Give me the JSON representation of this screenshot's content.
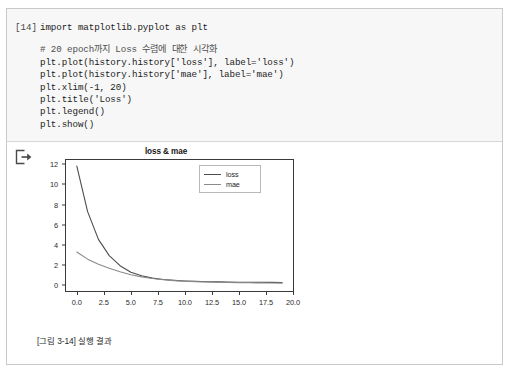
{
  "notebook": {
    "cell": {
      "execution_count_label": "[14]",
      "code_lines": [
        {
          "text": "import matplotlib.pyplot as plt",
          "kind": "code"
        },
        {
          "text": "",
          "kind": "blank"
        },
        {
          "text": "# 20 epoch까지 Loss 수렴에 대한 시각화",
          "kind": "comment"
        },
        {
          "text": "plt.plot(history.history['loss'], label='loss')",
          "kind": "code"
        },
        {
          "text": "plt.plot(history.history['mae'], label='mae')",
          "kind": "code"
        },
        {
          "text": "plt.xlim(-1, 20)",
          "kind": "code"
        },
        {
          "text": "plt.title('Loss')",
          "kind": "code"
        },
        {
          "text": "plt.legend()",
          "kind": "code"
        },
        {
          "text": "plt.show()",
          "kind": "code"
        }
      ]
    },
    "output": {
      "icon": "output-export-icon",
      "caption": "[그림 3-14] 실행 결과"
    }
  },
  "chart_data": {
    "type": "line",
    "title": "loss & mae",
    "xlabel": "",
    "ylabel": "",
    "xlim": [
      -1,
      20
    ],
    "ylim": [
      -0.55,
      12.4
    ],
    "grid": false,
    "legend_position": "upper right",
    "xticks": [
      "0.0",
      "2.5",
      "5.0",
      "7.5",
      "10.0",
      "12.5",
      "15.0",
      "17.5",
      "20.0"
    ],
    "xtick_values": [
      0.0,
      2.5,
      5.0,
      7.5,
      10.0,
      12.5,
      15.0,
      17.5,
      20.0
    ],
    "yticks": [
      "0",
      "2",
      "4",
      "6",
      "8",
      "10",
      "12"
    ],
    "ytick_values": [
      0,
      2,
      4,
      6,
      8,
      10,
      12
    ],
    "x": [
      0,
      1,
      2,
      3,
      4,
      5,
      6,
      7,
      8,
      9,
      10,
      11,
      12,
      13,
      14,
      15,
      16,
      17,
      18,
      19
    ],
    "series": [
      {
        "name": "loss",
        "color": "#4d4d4d",
        "values": [
          11.8,
          7.3,
          4.55,
          2.95,
          1.95,
          1.3,
          0.95,
          0.72,
          0.58,
          0.5,
          0.44,
          0.4,
          0.37,
          0.35,
          0.33,
          0.32,
          0.31,
          0.3,
          0.3,
          0.29
        ]
      },
      {
        "name": "mae",
        "color": "#8a8a8a",
        "values": [
          3.3,
          2.6,
          2.1,
          1.7,
          1.35,
          1.05,
          0.85,
          0.68,
          0.56,
          0.48,
          0.42,
          0.38,
          0.34,
          0.31,
          0.29,
          0.27,
          0.26,
          0.25,
          0.24,
          0.23
        ]
      }
    ]
  }
}
